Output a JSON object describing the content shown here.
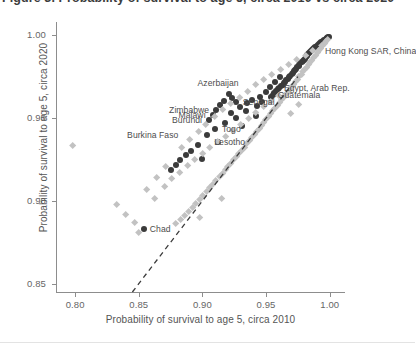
{
  "figure": {
    "clipped_title": "Figure 3. Probability of survival to age 5, circa 2010 vs circa 2020"
  },
  "chart_data": {
    "type": "scatter",
    "title": "",
    "xlabel": "Probability of survival to age 5, circa 2010",
    "ylabel": "Probability of survival to age 5, circa 2020",
    "xlim": [
      0.785,
      1.012
    ],
    "ylim": [
      0.845,
      1.008
    ],
    "xticks": [
      0.8,
      0.85,
      0.9,
      0.95,
      1.0
    ],
    "xticklabels": [
      "0.80",
      "0.85",
      "0.90",
      "0.95",
      "1.00"
    ],
    "yticks": [
      0.85,
      0.9,
      0.95,
      1.0
    ],
    "yticklabels": [
      "0.85",
      "0.90",
      "0.95",
      "1.00"
    ],
    "grid": false,
    "legend": "none",
    "reference_line": {
      "type": "diagonal",
      "label": "y = x (45-degree line)",
      "style": "dashed",
      "color": "#3b3b3b",
      "x_start": 0.845,
      "y_start": 0.845,
      "x_end": 0.975,
      "y_end": 0.975
    },
    "series": [
      {
        "name": "dark-circles",
        "marker": "circle",
        "color": "#3b3b3b",
        "points": [
          {
            "x": 0.9995,
            "y": 0.9992
          },
          {
            "x": 0.9988,
            "y": 0.999
          },
          {
            "x": 0.998,
            "y": 0.9985
          },
          {
            "x": 0.9975,
            "y": 0.9982
          },
          {
            "x": 0.9968,
            "y": 0.9978
          },
          {
            "x": 0.996,
            "y": 0.9974
          },
          {
            "x": 0.9952,
            "y": 0.997
          },
          {
            "x": 0.9945,
            "y": 0.9966
          },
          {
            "x": 0.9938,
            "y": 0.9962
          },
          {
            "x": 0.993,
            "y": 0.9958
          },
          {
            "x": 0.9922,
            "y": 0.9952
          },
          {
            "x": 0.9915,
            "y": 0.9948
          },
          {
            "x": 0.9908,
            "y": 0.9944
          },
          {
            "x": 0.99,
            "y": 0.9938
          },
          {
            "x": 0.9892,
            "y": 0.9932
          },
          {
            "x": 0.9885,
            "y": 0.9928
          },
          {
            "x": 0.9878,
            "y": 0.9922
          },
          {
            "x": 0.987,
            "y": 0.9916
          },
          {
            "x": 0.9862,
            "y": 0.991
          },
          {
            "x": 0.9855,
            "y": 0.9905
          },
          {
            "x": 0.9848,
            "y": 0.9898
          },
          {
            "x": 0.984,
            "y": 0.9892
          },
          {
            "x": 0.9832,
            "y": 0.9885
          },
          {
            "x": 0.9825,
            "y": 0.9878
          },
          {
            "x": 0.9818,
            "y": 0.9872
          },
          {
            "x": 0.981,
            "y": 0.9866
          },
          {
            "x": 0.9802,
            "y": 0.9858
          },
          {
            "x": 0.9795,
            "y": 0.9852
          },
          {
            "x": 0.9788,
            "y": 0.9845
          },
          {
            "x": 0.978,
            "y": 0.9838
          },
          {
            "x": 0.977,
            "y": 0.983
          },
          {
            "x": 0.9762,
            "y": 0.9822
          },
          {
            "x": 0.9755,
            "y": 0.9815
          },
          {
            "x": 0.9745,
            "y": 0.9806
          },
          {
            "x": 0.9735,
            "y": 0.9798
          },
          {
            "x": 0.9728,
            "y": 0.979
          },
          {
            "x": 0.9718,
            "y": 0.9782
          },
          {
            "x": 0.9708,
            "y": 0.9772
          },
          {
            "x": 0.97,
            "y": 0.9764
          },
          {
            "x": 0.969,
            "y": 0.9756
          },
          {
            "x": 0.968,
            "y": 0.9746
          },
          {
            "x": 0.9672,
            "y": 0.9738
          },
          {
            "x": 0.966,
            "y": 0.9728
          },
          {
            "x": 0.965,
            "y": 0.972
          },
          {
            "x": 0.964,
            "y": 0.9712
          },
          {
            "x": 0.963,
            "y": 0.9702
          },
          {
            "x": 0.9618,
            "y": 0.9694
          },
          {
            "x": 0.9605,
            "y": 0.9684
          },
          {
            "x": 0.9592,
            "y": 0.9674
          },
          {
            "x": 0.958,
            "y": 0.9664
          },
          {
            "x": 0.9566,
            "y": 0.9652
          },
          {
            "x": 0.9552,
            "y": 0.9642
          },
          {
            "x": 0.9538,
            "y": 0.963
          },
          {
            "x": 0.9612,
            "y": 0.9745
          },
          {
            "x": 0.957,
            "y": 0.9718
          },
          {
            "x": 0.953,
            "y": 0.969
          },
          {
            "x": 0.9496,
            "y": 0.966
          },
          {
            "x": 0.9455,
            "y": 0.963
          },
          {
            "x": 0.947,
            "y": 0.96
          },
          {
            "x": 0.943,
            "y": 0.9572
          },
          {
            "x": 0.939,
            "y": 0.9612
          },
          {
            "x": 0.9352,
            "y": 0.9588
          },
          {
            "x": 0.934,
            "y": 0.954
          },
          {
            "x": 0.9298,
            "y": 0.9565
          },
          {
            "x": 0.9262,
            "y": 0.9596
          },
          {
            "x": 0.9232,
            "y": 0.9622
          },
          {
            "x": 0.9205,
            "y": 0.9648
          },
          {
            "x": 0.9168,
            "y": 0.9604
          },
          {
            "x": 0.9142,
            "y": 0.9576
          },
          {
            "x": 0.9108,
            "y": 0.9548
          },
          {
            "x": 0.908,
            "y": 0.9518
          },
          {
            "x": 0.9052,
            "y": 0.9488
          },
          {
            "x": 0.9228,
            "y": 0.9532
          },
          {
            "x": 0.9262,
            "y": 0.9502
          },
          {
            "x": 0.9178,
            "y": 0.9468
          },
          {
            "x": 0.9098,
            "y": 0.9432
          },
          {
            "x": 0.9038,
            "y": 0.9398
          },
          {
            "x": 0.8968,
            "y": 0.9338
          },
          {
            "x": 0.8912,
            "y": 0.9302
          },
          {
            "x": 0.8868,
            "y": 0.9278
          },
          {
            "x": 0.8826,
            "y": 0.9248
          },
          {
            "x": 0.8792,
            "y": 0.9216
          },
          {
            "x": 0.8752,
            "y": 0.9188
          },
          {
            "x": 0.854,
            "y": 0.8832
          },
          {
            "x": 0.8998,
            "y": 0.9255
          },
          {
            "x": 0.9122,
            "y": 0.9358
          },
          {
            "x": 0.9308,
            "y": 0.9452
          },
          {
            "x": 0.9422,
            "y": 0.9512
          }
        ]
      },
      {
        "name": "light-diamonds",
        "marker": "diamond",
        "color": "#c2c2c2",
        "points": [
          {
            "x": 0.9985,
            "y": 0.9975
          },
          {
            "x": 0.9972,
            "y": 0.9962
          },
          {
            "x": 0.9958,
            "y": 0.9948
          },
          {
            "x": 0.9944,
            "y": 0.9935
          },
          {
            "x": 0.993,
            "y": 0.992
          },
          {
            "x": 0.9916,
            "y": 0.9906
          },
          {
            "x": 0.9902,
            "y": 0.9892
          },
          {
            "x": 0.9888,
            "y": 0.9878
          },
          {
            "x": 0.9874,
            "y": 0.9862
          },
          {
            "x": 0.986,
            "y": 0.9848
          },
          {
            "x": 0.9846,
            "y": 0.9834
          },
          {
            "x": 0.9832,
            "y": 0.982
          },
          {
            "x": 0.9818,
            "y": 0.9806
          },
          {
            "x": 0.9804,
            "y": 0.9792
          },
          {
            "x": 0.979,
            "y": 0.9778
          },
          {
            "x": 0.9776,
            "y": 0.9762
          },
          {
            "x": 0.976,
            "y": 0.9748
          },
          {
            "x": 0.9746,
            "y": 0.9732
          },
          {
            "x": 0.973,
            "y": 0.9718
          },
          {
            "x": 0.9715,
            "y": 0.9702
          },
          {
            "x": 0.97,
            "y": 0.9688
          },
          {
            "x": 0.9684,
            "y": 0.9672
          },
          {
            "x": 0.9668,
            "y": 0.9656
          },
          {
            "x": 0.9652,
            "y": 0.964
          },
          {
            "x": 0.9636,
            "y": 0.9624
          },
          {
            "x": 0.962,
            "y": 0.9608
          },
          {
            "x": 0.9604,
            "y": 0.9592
          },
          {
            "x": 0.9588,
            "y": 0.9576
          },
          {
            "x": 0.957,
            "y": 0.9558
          },
          {
            "x": 0.9554,
            "y": 0.9542
          },
          {
            "x": 0.9536,
            "y": 0.9524
          },
          {
            "x": 0.9518,
            "y": 0.9508
          },
          {
            "x": 0.95,
            "y": 0.949
          },
          {
            "x": 0.9482,
            "y": 0.9472
          },
          {
            "x": 0.9464,
            "y": 0.9454
          },
          {
            "x": 0.9446,
            "y": 0.9436
          },
          {
            "x": 0.9428,
            "y": 0.9418
          },
          {
            "x": 0.9408,
            "y": 0.94
          },
          {
            "x": 0.939,
            "y": 0.9382
          },
          {
            "x": 0.937,
            "y": 0.9362
          },
          {
            "x": 0.935,
            "y": 0.9344
          },
          {
            "x": 0.933,
            "y": 0.9324
          },
          {
            "x": 0.931,
            "y": 0.9306
          },
          {
            "x": 0.9288,
            "y": 0.9286
          },
          {
            "x": 0.9268,
            "y": 0.9266
          },
          {
            "x": 0.9246,
            "y": 0.9246
          },
          {
            "x": 0.9224,
            "y": 0.9226
          },
          {
            "x": 0.9202,
            "y": 0.9206
          },
          {
            "x": 0.918,
            "y": 0.9186
          },
          {
            "x": 0.9156,
            "y": 0.9164
          },
          {
            "x": 0.9132,
            "y": 0.9144
          },
          {
            "x": 0.9108,
            "y": 0.9122
          },
          {
            "x": 0.9084,
            "y": 0.91
          },
          {
            "x": 0.9058,
            "y": 0.9078
          },
          {
            "x": 0.9032,
            "y": 0.9056
          },
          {
            "x": 0.9006,
            "y": 0.9032
          },
          {
            "x": 0.8978,
            "y": 0.901
          },
          {
            "x": 0.895,
            "y": 0.8986
          },
          {
            "x": 0.8922,
            "y": 0.8962
          },
          {
            "x": 0.8892,
            "y": 0.8936
          },
          {
            "x": 0.886,
            "y": 0.8912
          },
          {
            "x": 0.8828,
            "y": 0.8886
          },
          {
            "x": 0.8792,
            "y": 0.886
          },
          {
            "x": 0.85,
            "y": 0.8808
          },
          {
            "x": 0.8628,
            "y": 0.9012
          },
          {
            "x": 0.8702,
            "y": 0.9088
          },
          {
            "x": 0.876,
            "y": 0.9136
          },
          {
            "x": 0.8822,
            "y": 0.9172
          },
          {
            "x": 0.8882,
            "y": 0.9212
          },
          {
            "x": 0.894,
            "y": 0.9248
          },
          {
            "x": 0.9,
            "y": 0.9288
          },
          {
            "x": 0.906,
            "y": 0.932
          },
          {
            "x": 0.912,
            "y": 0.9355
          },
          {
            "x": 0.918,
            "y": 0.939
          },
          {
            "x": 0.924,
            "y": 0.9425
          },
          {
            "x": 0.93,
            "y": 0.946
          },
          {
            "x": 0.936,
            "y": 0.9498
          },
          {
            "x": 0.942,
            "y": 0.9532
          },
          {
            "x": 0.948,
            "y": 0.9566
          },
          {
            "x": 0.954,
            "y": 0.96
          },
          {
            "x": 0.96,
            "y": 0.9634
          },
          {
            "x": 0.7985,
            "y": 0.9335
          },
          {
            "x": 0.833,
            "y": 0.898
          },
          {
            "x": 0.8398,
            "y": 0.8918
          },
          {
            "x": 0.8468,
            "y": 0.8866
          },
          {
            "x": 0.8562,
            "y": 0.9068
          },
          {
            "x": 0.864,
            "y": 0.9142
          },
          {
            "x": 0.8708,
            "y": 0.9208
          },
          {
            "x": 0.8838,
            "y": 0.9322
          },
          {
            "x": 0.8902,
            "y": 0.9372
          },
          {
            "x": 0.8968,
            "y": 0.9418
          },
          {
            "x": 0.9028,
            "y": 0.9462
          },
          {
            "x": 0.9098,
            "y": 0.9508
          },
          {
            "x": 0.9158,
            "y": 0.9548
          },
          {
            "x": 0.9222,
            "y": 0.9588
          },
          {
            "x": 0.929,
            "y": 0.9625
          },
          {
            "x": 0.9355,
            "y": 0.9662
          },
          {
            "x": 0.9418,
            "y": 0.97
          },
          {
            "x": 0.9482,
            "y": 0.973
          },
          {
            "x": 0.9548,
            "y": 0.9762
          },
          {
            "x": 0.9612,
            "y": 0.9792
          },
          {
            "x": 0.9678,
            "y": 0.9822
          },
          {
            "x": 0.9742,
            "y": 0.985
          },
          {
            "x": 0.9808,
            "y": 0.9878
          },
          {
            "x": 0.987,
            "y": 0.9905
          },
          {
            "x": 0.9935,
            "y": 0.9935
          },
          {
            "x": 0.915,
            "y": 0.9012
          },
          {
            "x": 0.8975,
            "y": 0.89
          },
          {
            "x": 0.976,
            "y": 0.9578
          },
          {
            "x": 0.969,
            "y": 0.9528
          }
        ]
      }
    ],
    "annotations": [
      {
        "text": "Hong Kong SAR, China",
        "x": 0.99,
        "y": 0.9905,
        "align": "right",
        "dx": 8,
        "dy": 0
      },
      {
        "text": "Azerbaijan",
        "x": 0.934,
        "y": 0.9712,
        "align": "left",
        "dx": -7,
        "dy": 0
      },
      {
        "text": "Egypt, Arab Rep.",
        "x": 0.9585,
        "y": 0.968,
        "align": "right",
        "dx": 7,
        "dy": 0
      },
      {
        "text": "Guatemala",
        "x": 0.9545,
        "y": 0.964,
        "align": "right",
        "dx": 6,
        "dy": 0
      },
      {
        "text": "Senegal",
        "x": 0.9262,
        "y": 0.9596,
        "align": "right",
        "dx": 7,
        "dy": 0
      },
      {
        "text": "Zimbabwe",
        "x": 0.9108,
        "y": 0.9548,
        "align": "left",
        "dx": -7,
        "dy": 0
      },
      {
        "text": "Malawi",
        "x": 0.908,
        "y": 0.9518,
        "align": "left",
        "dx": -7,
        "dy": 0
      },
      {
        "text": "Burundi",
        "x": 0.9052,
        "y": 0.9488,
        "align": "left",
        "dx": -7,
        "dy": 0
      },
      {
        "text": "Togo",
        "x": 0.9098,
        "y": 0.9432,
        "align": "right",
        "dx": 7,
        "dy": 0
      },
      {
        "text": "Burkina Faso",
        "x": 0.8968,
        "y": 0.9398,
        "align": "left",
        "dx": -20,
        "dy": 0
      },
      {
        "text": "Lesotho",
        "x": 0.9038,
        "y": 0.9358,
        "align": "right",
        "dx": 7,
        "dy": 0
      },
      {
        "text": "Chad",
        "x": 0.854,
        "y": 0.8832,
        "align": "right",
        "dx": 6,
        "dy": 0
      }
    ]
  }
}
